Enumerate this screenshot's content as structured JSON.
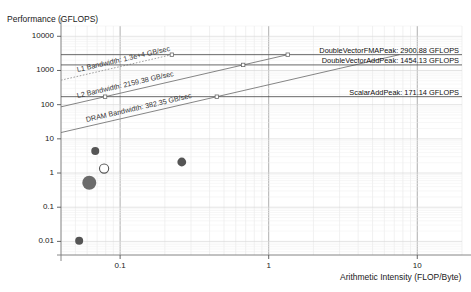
{
  "chart_data": {
    "type": "line",
    "title": "",
    "ylabel": "Performance (GFLOPS)",
    "xlabel": "Arithmetic Intensity (FLOP/Byte)",
    "xscale": "log",
    "yscale": "log",
    "xlim": [
      0.04,
      20
    ],
    "ylim": [
      0.004,
      20000
    ],
    "grid": true,
    "legend": "none",
    "xticks": [
      {
        "value": 0.1,
        "label": "0.1"
      },
      {
        "value": 1,
        "label": "1"
      },
      {
        "value": 10,
        "label": "10"
      }
    ],
    "yticks": [
      {
        "value": 10000,
        "label": "10000"
      },
      {
        "value": 1000,
        "label": "1000"
      },
      {
        "value": 100,
        "label": "100"
      },
      {
        "value": 10,
        "label": "10"
      },
      {
        "value": 1,
        "label": "1"
      },
      {
        "value": 0.1,
        "label": "0.1"
      },
      {
        "value": 0.01,
        "label": "0.01"
      }
    ],
    "compute_ceilings": [
      {
        "name": "DoubleVectorFMAPeak",
        "value": 2900.88,
        "unit": "GFLOPS",
        "label": "DoubleVectorFMAPeak: 2900.88 GFLOPS",
        "style": "solid"
      },
      {
        "name": "DoubleVectorAddPeak",
        "value": 1454.13,
        "unit": "GFLOPS",
        "label": "DoubleVectorAddPeak: 1454.13 GFLOPS",
        "style": "solid"
      },
      {
        "name": "ScalarAddPeak",
        "value": 171.14,
        "unit": "GFLOPS",
        "label": "ScalarAddPeak: 171.14 GFLOPS",
        "style": "solid"
      }
    ],
    "memory_ceilings": [
      {
        "name": "L1 Bandwidth",
        "value": 13000,
        "unit": "GB/sec",
        "label": "L1 Bandwidth: 1.3e+4 GB/sec",
        "style": "dotted"
      },
      {
        "name": "L2 Bandwidth",
        "value": 2159.38,
        "unit": "GB/sec",
        "label": "L2 Bandwidth: 2159.38 GB/sec",
        "style": "solid"
      },
      {
        "name": "DRAM Bandwidth",
        "value": 382.35,
        "unit": "GB/sec",
        "label": "DRAM Bandwidth: 382.35 GB/sec",
        "style": "solid"
      }
    ],
    "points": [
      {
        "x": 0.068,
        "y": 4.4,
        "size": 4.0,
        "filled": true,
        "color": "#555555"
      },
      {
        "x": 0.078,
        "y": 1.35,
        "size": 4.6,
        "filled": false,
        "color": "#555555"
      },
      {
        "x": 0.062,
        "y": 0.52,
        "size": 7.0,
        "filled": true,
        "color": "#6b6b6b"
      },
      {
        "x": 0.053,
        "y": 0.0105,
        "size": 4.0,
        "filled": true,
        "color": "#555555"
      },
      {
        "x": 0.26,
        "y": 2.1,
        "size": 4.4,
        "filled": true,
        "color": "#555555"
      }
    ],
    "knee_markers": [
      {
        "x": 0.223,
        "y": 2900.88
      },
      {
        "x": 1.343,
        "y": 2900.88
      },
      {
        "x": 0.673,
        "y": 1454.13
      },
      {
        "x": 0.0792,
        "y": 171.14
      },
      {
        "x": 0.4476,
        "y": 171.14
      }
    ]
  }
}
